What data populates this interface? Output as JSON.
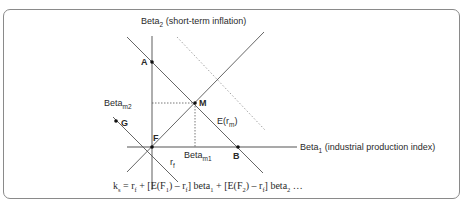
{
  "diagram": {
    "y_axis_label": {
      "main": "Beta",
      "sub": "2",
      "rest": " (short-term inflation)"
    },
    "x_axis_label": {
      "main": "Beta",
      "sub": "1",
      "rest": " (industrial production index)"
    },
    "points": {
      "A": "A",
      "M": "M",
      "B": "B",
      "F": "F",
      "G": "G"
    },
    "beta_m2": {
      "main": "Beta",
      "sub": "m2"
    },
    "beta_m1": {
      "main": "Beta",
      "sub": "m1"
    },
    "expected_return_label": {
      "main": "E(r",
      "sub": "m",
      "rest": ")"
    },
    "rf_label": {
      "main": "r",
      "sub": "f"
    },
    "formula": {
      "k": "k",
      "k_sub": "s",
      "p1": " = r",
      "p1_sub": "f",
      "p2": " + [E(F",
      "p2_sub": "1",
      "p3": ") – r",
      "p3_sub": "f",
      "p4": "] beta",
      "p4_sub": "1",
      "p5": " + [E(F",
      "p5_sub": "2",
      "p6": ") – r",
      "p6_sub": "f",
      "p7": "] beta",
      "p7_sub": "2",
      "p8": " …"
    },
    "colors": {
      "axis": "#8c8c8c",
      "line": "#555555",
      "dotted": "#9a9a9a",
      "text": "#2a2a2a",
      "frame": "#8a8a8a"
    }
  }
}
